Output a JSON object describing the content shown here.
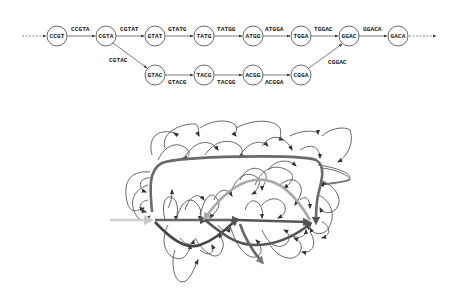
{
  "debruijn_path": {
    "top_row_nodes": [
      {
        "label": "CCGT",
        "x": 57,
        "y": 36
      },
      {
        "label": "CGTA",
        "x": 106,
        "y": 36
      },
      {
        "label": "GTAT",
        "x": 155,
        "y": 36
      },
      {
        "label": "TATG",
        "x": 204,
        "y": 36
      },
      {
        "label": "ATGG",
        "x": 253,
        "y": 36
      },
      {
        "label": "TGGA",
        "x": 301,
        "y": 36
      },
      {
        "label": "GGAC",
        "x": 349,
        "y": 36
      },
      {
        "label": "GACA",
        "x": 398,
        "y": 36
      }
    ],
    "top_row_edge_labels": [
      "CCGTA",
      "CGTAT",
      "GTATG",
      "TATGG",
      "ATGGA",
      "TGGAC",
      "GGACA"
    ],
    "bottom_row_nodes": [
      {
        "label": "GTAC",
        "x": 155,
        "y": 75
      },
      {
        "label": "TACG",
        "x": 204,
        "y": 75
      },
      {
        "label": "ACGG",
        "x": 253,
        "y": 75
      },
      {
        "label": "CGGA",
        "x": 301,
        "y": 75
      }
    ],
    "bottom_row_edge_labels": [
      "GTACG",
      "TACGG",
      "ACGGA"
    ],
    "branch_out_label": "CGTAC",
    "branch_in_label": "CGGAC"
  },
  "tangled_graph": {
    "description": "Complex de Bruijn graph with repeats; highlighted thick paths",
    "colors": {
      "dark_path": "#555555",
      "mid_path": "#7a7a7a",
      "light_path": "#a8a8a8",
      "entry_arrow": "#cfcfcf",
      "thin_edges": "#555555"
    }
  }
}
